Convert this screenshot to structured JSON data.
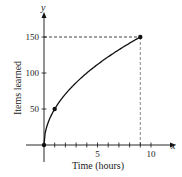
{
  "chart_data": {
    "type": "line",
    "title": "",
    "xlabel": "Time (hours)",
    "ylabel": "Items learned",
    "x_axis_var": "x",
    "y_axis_var": "y",
    "xlim": [
      0,
      11
    ],
    "ylim": [
      0,
      160
    ],
    "x_ticks": [
      1,
      2,
      3,
      4,
      5,
      6,
      7,
      8,
      9,
      10
    ],
    "x_tick_labels": [
      "5",
      "10"
    ],
    "x_tick_label_values": [
      5,
      10
    ],
    "y_ticks": [
      50,
      100,
      150
    ],
    "y_tick_labels": [
      "50",
      "100",
      "150"
    ],
    "grid": false,
    "legend": null,
    "function": "y = 50*sqrt(x)",
    "series": [
      {
        "name": "Items learned",
        "x": [
          0,
          0.25,
          0.5,
          1,
          2,
          3,
          4,
          5,
          6,
          7,
          8,
          9
        ],
        "y": [
          0,
          25,
          35.4,
          50,
          70.7,
          86.6,
          100,
          111.8,
          122.5,
          132.3,
          141.4,
          150
        ]
      }
    ],
    "marked_points": [
      {
        "x": 0,
        "y": 0
      },
      {
        "x": 1,
        "y": 50
      },
      {
        "x": 9,
        "y": 150
      }
    ],
    "reference_lines": [
      {
        "type": "horizontal",
        "y": 150,
        "from_x": 0,
        "to_x": 9,
        "style": "dashed"
      },
      {
        "type": "vertical",
        "x": 9,
        "from_y": 0,
        "to_y": 150,
        "style": "dashed"
      }
    ]
  },
  "colors": {
    "curve": "#111111",
    "axes": "#111111",
    "dashed": "#888888",
    "text": "#222222"
  }
}
